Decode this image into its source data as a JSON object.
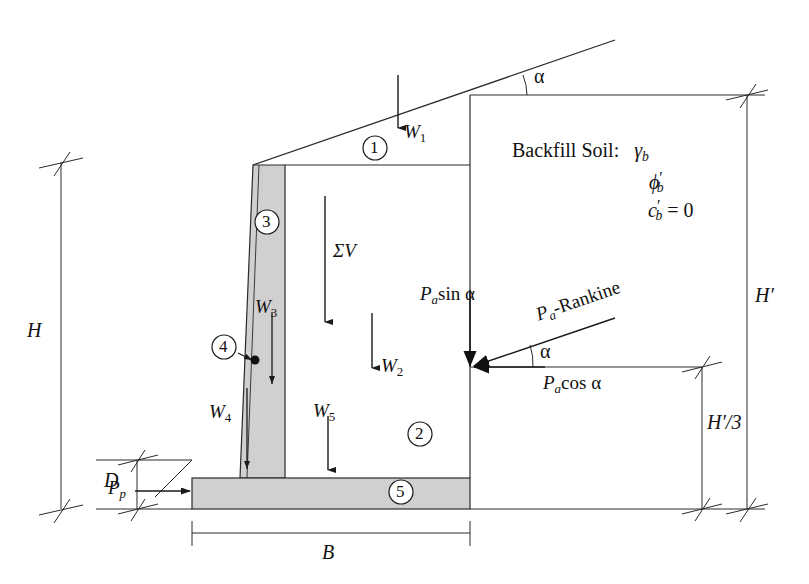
{
  "figure": {
    "type": "engineering-diagram",
    "background_color": "#ffffff",
    "line_color": "#1a1a1a",
    "concrete_fill_color": "#cfcfcf"
  },
  "labels": {
    "H": "H",
    "D": "D",
    "B": "B",
    "H_prime": "H′",
    "H_prime_over_3": "H′/3",
    "alpha_top": "α",
    "alpha_force": "α",
    "sigma_V": "ΣV",
    "Pp": "P",
    "Pp_sub": "p",
    "Pa_sin": "P",
    "Pa_sin_sub": "a",
    "Pa_sin_rest": "sin α",
    "Pa_cos": "P",
    "Pa_cos_sub": "a",
    "Pa_cos_rest": "cos α",
    "Pa_rankine": "P",
    "Pa_rankine_sub": "a",
    "Pa_rankine_rest": "-Rankine",
    "W1": "W",
    "W1_sub": "1",
    "W2": "W",
    "W2_sub": "2",
    "W3": "W",
    "W3_sub": "3",
    "W4": "W",
    "W4_sub": "4",
    "W5": "W",
    "W5_sub": "5"
  },
  "backfill_note": {
    "title": "Backfill Soil:",
    "gamma": "γ",
    "gamma_sub": "b",
    "phi": "ϕ",
    "phi_prime": "′",
    "phi_sub": "b",
    "c": "c",
    "c_prime": "′",
    "c_sub": "b",
    "c_value": "= 0"
  },
  "region_callouts": [
    {
      "id": "1",
      "label": "1",
      "desc": "soil wedge above backfill top line"
    },
    {
      "id": "2",
      "label": "2",
      "desc": "main backfill soil block over heel"
    },
    {
      "id": "3",
      "label": "3",
      "desc": "wall stem (concrete)"
    },
    {
      "id": "4",
      "label": "4",
      "desc": "stem taper sliver"
    },
    {
      "id": "5",
      "label": "5",
      "desc": "base slab / footing (concrete)"
    }
  ],
  "forces": [
    {
      "name": "W1",
      "direction": "down",
      "desc": "weight of soil wedge 1"
    },
    {
      "name": "W2",
      "direction": "down",
      "desc": "weight of soil block 2"
    },
    {
      "name": "W3",
      "direction": "down",
      "desc": "weight of stem 3"
    },
    {
      "name": "W4",
      "direction": "down",
      "desc": "weight of stem sliver 4"
    },
    {
      "name": "W5",
      "direction": "down",
      "desc": "weight of base slab 5"
    },
    {
      "name": "ΣV",
      "direction": "down",
      "desc": "resultant vertical force"
    },
    {
      "name": "Pa-Rankine",
      "direction": "inclined-at-alpha",
      "desc": "Rankine active thrust"
    },
    {
      "name": "Pa sin α",
      "direction": "down",
      "desc": "vertical component of active thrust"
    },
    {
      "name": "Pa cos α",
      "direction": "left",
      "desc": "horizontal component of active thrust"
    },
    {
      "name": "Pp",
      "direction": "right",
      "desc": "passive resistance on toe"
    }
  ]
}
